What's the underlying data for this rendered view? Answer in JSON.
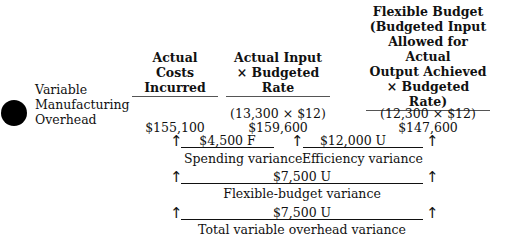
{
  "row_label": {
    "lines": [
      "Variable",
      "Manufacturing",
      "Overhead"
    ]
  },
  "columns": [
    {
      "header_lines": [
        "Actual Costs",
        "Incurred"
      ],
      "formula": "",
      "amount": "$155,100"
    },
    {
      "header_lines": [
        "Actual Input",
        "× Budgeted Rate"
      ],
      "formula": "(13,300 × $12)",
      "amount": "$159,600"
    },
    {
      "header_lines": [
        "Flexible Budget",
        "(Budgeted Input",
        "Allowed for Actual",
        "Output Achieved",
        "× Budgeted Rate)"
      ],
      "formula": "(12,300 ×  $12)",
      "amount": "$147,600"
    }
  ],
  "variances": {
    "spending": {
      "amount": "$4,500 F",
      "label": "Spending variance"
    },
    "efficiency": {
      "amount": "$12,000 U",
      "label": "Efficiency variance"
    },
    "flexible_budget": {
      "amount": "$7,500 U",
      "label": "Flexible-budget variance"
    },
    "total": {
      "amount": "$7,500 U",
      "label": "Total variable overhead variance"
    }
  },
  "icons": {
    "arrow": "↑"
  }
}
